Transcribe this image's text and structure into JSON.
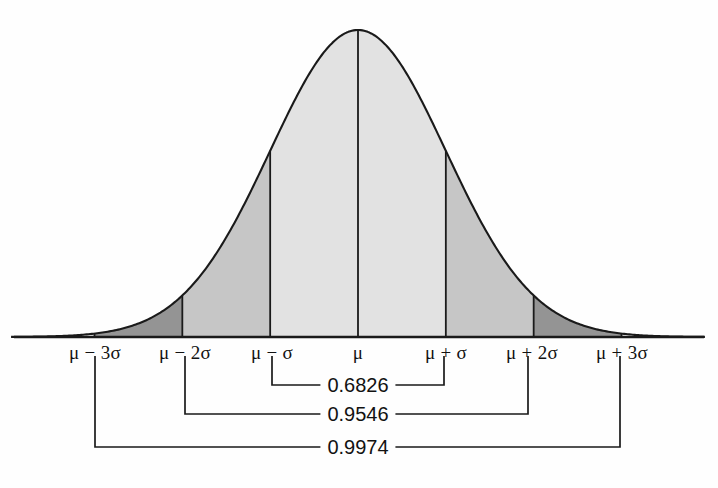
{
  "figure": {
    "title": "",
    "background_color": "#fefefe",
    "axis_color": "#1a1a1a",
    "curve_color": "#1a1a1a"
  },
  "colors": {
    "band_light": "#e2e2e2",
    "band_medium": "#c6c6c6",
    "band_dark": "#949494",
    "tail_white": "#ffffff",
    "line": "#1a1a1a",
    "text": "#121212"
  },
  "axis": {
    "baseline_y": 337,
    "left_x": 14,
    "right_x": 704,
    "tick_labels": [
      {
        "text": "μ − 3σ",
        "x": 95
      },
      {
        "text": "μ − 2σ",
        "x": 185
      },
      {
        "text": "μ − σ",
        "x": 272
      },
      {
        "text": "μ",
        "x": 358
      },
      {
        "text": "μ + σ",
        "x": 446
      },
      {
        "text": "μ + 2σ",
        "x": 532
      },
      {
        "text": "μ + 3σ",
        "x": 622
      }
    ],
    "label_y": 342
  },
  "brackets": [
    {
      "name": "one-sigma-bracket",
      "value": "0.6826",
      "left_x": 272,
      "right_x": 444,
      "top_y": 356,
      "rule_y": 385,
      "label_x": 358
    },
    {
      "name": "two-sigma-bracket",
      "value": "0.9546",
      "left_x": 185,
      "right_x": 528,
      "top_y": 356,
      "rule_y": 414,
      "label_x": 358
    },
    {
      "name": "three-sigma-bracket",
      "value": "0.9974",
      "left_x": 95,
      "right_x": 620,
      "top_y": 356,
      "rule_y": 447,
      "label_x": 358
    }
  ],
  "chart_data": {
    "type": "area",
    "xlabel": "",
    "ylabel": "",
    "distribution": "normal",
    "mean_label": "μ",
    "sd_label": "σ",
    "grid": false,
    "legend": "none",
    "x_tick_labels": [
      "μ − 3σ",
      "μ − 2σ",
      "μ − σ",
      "μ",
      "μ + σ",
      "μ + 2σ",
      "μ + 3σ"
    ],
    "x_tick_values": [
      -3,
      -2,
      -1,
      0,
      1,
      2,
      3
    ],
    "xlim": [
      -3.95,
      3.95
    ],
    "ylim": [
      0,
      1
    ],
    "curve_points_z": [
      -3.95,
      -3.5,
      -3,
      -2.5,
      -2,
      -1.5,
      -1,
      -0.5,
      0,
      0.5,
      1,
      1.5,
      2,
      2.5,
      3,
      3.5,
      3.95
    ],
    "curve_points_density": [
      0.0003,
      0.0022,
      0.0111,
      0.0439,
      0.1353,
      0.3247,
      0.6065,
      0.8825,
      1.0,
      0.8825,
      0.6065,
      0.3247,
      0.1353,
      0.0439,
      0.0111,
      0.0022,
      0.0003
    ],
    "shaded_bands": [
      {
        "from": -3,
        "to": -2,
        "shade": "dark",
        "color": "#949494"
      },
      {
        "from": -2,
        "to": -1,
        "shade": "medium",
        "color": "#c6c6c6"
      },
      {
        "from": -1,
        "to": 0,
        "shade": "light",
        "color": "#e2e2e2"
      },
      {
        "from": 0,
        "to": 1,
        "shade": "light",
        "color": "#e2e2e2"
      },
      {
        "from": 1,
        "to": 2,
        "shade": "medium",
        "color": "#c6c6c6"
      },
      {
        "from": 2,
        "to": 3,
        "shade": "dark",
        "color": "#949494"
      }
    ],
    "annotations": [
      {
        "label": "0.6826",
        "span": [
          "μ − σ",
          "μ + σ"
        ],
        "z_span": [
          -1,
          1
        ],
        "value": 0.6826
      },
      {
        "label": "0.9546",
        "span": [
          "μ − 2σ",
          "μ + 2σ"
        ],
        "z_span": [
          -2,
          2
        ],
        "value": 0.9546
      },
      {
        "label": "0.9974",
        "span": [
          "μ − 3σ",
          "μ + 3σ"
        ],
        "z_span": [
          -3,
          3
        ],
        "value": 0.9974
      }
    ]
  }
}
